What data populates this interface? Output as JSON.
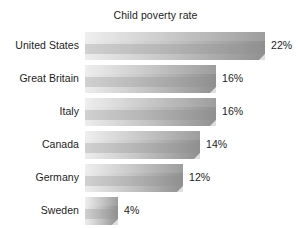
{
  "chart_data": {
    "type": "bar",
    "title": "Child poverty rate",
    "xlabel": "",
    "ylabel": "",
    "orientation": "horizontal",
    "grid": false,
    "legend": false,
    "xlim": [
      0,
      25
    ],
    "categories": [
      "United States",
      "Great Britain",
      "Italy",
      "Canada",
      "Germany",
      "Sweden"
    ],
    "values": [
      22,
      16,
      16,
      14,
      12,
      4
    ],
    "value_labels": [
      "22%",
      "16%",
      "16%",
      "14%",
      "12%",
      "4%"
    ],
    "units": "percent",
    "bars": [
      {
        "category": "United States",
        "value": 22,
        "label": "22%"
      },
      {
        "category": "Great Britain",
        "value": 16,
        "label": "16%"
      },
      {
        "category": "Italy",
        "value": 16,
        "label": "16%"
      },
      {
        "category": "Canada",
        "value": 14,
        "label": "14%"
      },
      {
        "category": "Germany",
        "value": 12,
        "label": "12%"
      },
      {
        "category": "Sweden",
        "value": 4,
        "label": "4%"
      }
    ]
  },
  "colors": {
    "background": "#ffffff",
    "text": "#1c1c1c",
    "bar_gradient_light": "#ededed",
    "bar_gradient_dark": "#909090",
    "bar_top_face": "#d8d8d8",
    "bar_cap_face": "#8a8a8a"
  }
}
